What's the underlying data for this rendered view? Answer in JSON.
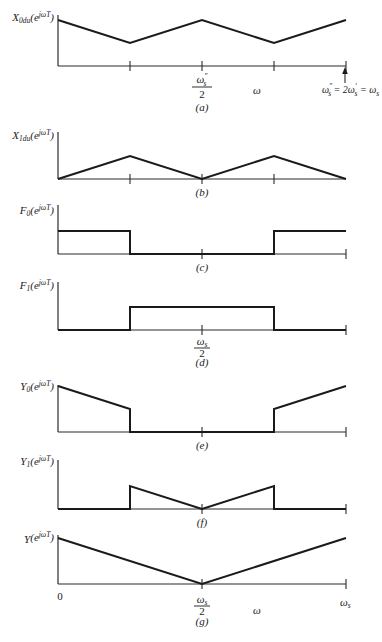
{
  "figure": {
    "x_px_start": 58,
    "x_px_end": 346,
    "amp_px": 46,
    "panels": [
      {
        "id": "a",
        "caption": "(a)",
        "baseline": 66,
        "axis_top": 15,
        "ticks": [
          0.25,
          0.5,
          0.75,
          1
        ],
        "ylabel": {
          "base": "X",
          "sub": "0du",
          "arg": "(e",
          "sup": "jωT",
          "close": ")"
        },
        "series": [
          [
            0,
            1
          ],
          [
            0.25,
            0.5
          ],
          [
            0.5,
            1
          ],
          [
            0.75,
            0.5
          ],
          [
            1,
            1
          ]
        ]
      },
      {
        "id": "b",
        "caption": "(b)",
        "baseline": 179,
        "axis_top": 132,
        "ticks": [
          0.25,
          0.5,
          0.75
        ],
        "ylabel": {
          "base": "X",
          "sub": "1du",
          "arg": "(e",
          "sup": "jωT",
          "close": ")"
        },
        "series": [
          [
            0,
            0
          ],
          [
            0.25,
            0.5
          ],
          [
            0.5,
            0
          ],
          [
            0.75,
            0.5
          ],
          [
            1,
            0
          ]
        ]
      },
      {
        "id": "c",
        "caption": "(c)",
        "baseline": 254,
        "axis_top": 205,
        "ticks": [
          0.5,
          1
        ],
        "ylabel": {
          "base": "F",
          "sub": "0",
          "arg": "(e",
          "sup": "jωT",
          "close": ")"
        },
        "series": [
          [
            0,
            0.5
          ],
          [
            0.25,
            0.5
          ],
          [
            0.25,
            0
          ],
          [
            0.75,
            0
          ],
          [
            0.75,
            0.5
          ],
          [
            1,
            0.5
          ]
        ]
      },
      {
        "id": "d",
        "caption": "(d)",
        "baseline": 330,
        "axis_top": 282,
        "ticks": [
          0.5,
          1
        ],
        "ylabel": {
          "base": "F",
          "sub": "1",
          "arg": "(e",
          "sup": "jωT",
          "close": ")"
        },
        "series": [
          [
            0,
            0
          ],
          [
            0.25,
            0
          ],
          [
            0.25,
            0.5
          ],
          [
            0.75,
            0.5
          ],
          [
            0.75,
            0
          ],
          [
            1,
            0
          ]
        ]
      },
      {
        "id": "e",
        "caption": "(e)",
        "baseline": 432,
        "axis_top": 385,
        "ticks": [
          0.5,
          1
        ],
        "ylabel": {
          "base": "Y",
          "sub": "0",
          "arg": "(e",
          "sup": "jωT",
          "close": ")"
        },
        "series": [
          [
            0,
            1
          ],
          [
            0.25,
            0.5
          ],
          [
            0.25,
            0
          ],
          [
            0.75,
            0
          ],
          [
            0.75,
            0.5
          ],
          [
            1,
            1
          ]
        ]
      },
      {
        "id": "f",
        "caption": "(f)",
        "baseline": 509,
        "axis_top": 460,
        "ticks": [
          0.5,
          1
        ],
        "ylabel": {
          "base": "Y",
          "sub": "1",
          "arg": "(e",
          "sup": "jωT",
          "close": ")"
        },
        "series": [
          [
            0,
            0
          ],
          [
            0.25,
            0
          ],
          [
            0.25,
            0.5
          ],
          [
            0.5,
            0
          ],
          [
            0.75,
            0.5
          ],
          [
            0.75,
            0
          ],
          [
            1,
            0
          ]
        ]
      },
      {
        "id": "g",
        "caption": "(g)",
        "baseline": 584,
        "axis_top": 535,
        "ticks": [
          0.5,
          1
        ],
        "ylabel": {
          "base": "Y",
          "sub": "",
          "arg": "(e",
          "sup": "jωT",
          "close": ")"
        },
        "series": [
          [
            0,
            1
          ],
          [
            0.5,
            0
          ],
          [
            1,
            1
          ]
        ]
      }
    ],
    "annotations": {
      "a_half": {
        "num": "ω",
        "num_sup": "″",
        "num_sub": "s",
        "den": "2"
      },
      "a_omega": "ω",
      "a_arrow_label": {
        "p1": "ω",
        "p1_sup": "″",
        "p1_sub": "s",
        "p2": " = 2ω",
        "p2_sup": "′",
        "p2_sub": "s",
        "p3": " = ω",
        "p3_sub": "s"
      },
      "d_half": {
        "num": "ω",
        "num_sub": "s",
        "den": "2"
      },
      "g_zero": "0",
      "g_half": {
        "num": "ω",
        "num_sub": "s",
        "den": "2"
      },
      "g_omega": "ω",
      "g_end": {
        "main": "ω",
        "sub": "s"
      }
    }
  }
}
